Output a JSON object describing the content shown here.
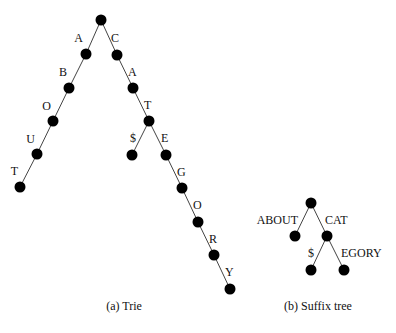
{
  "figures": [
    {
      "id": "trie",
      "caption": "(a) Trie",
      "nodes": [
        {
          "id": "root",
          "x": 101,
          "y": 20
        },
        {
          "id": "A",
          "x": 86,
          "y": 54
        },
        {
          "id": "AB",
          "x": 69,
          "y": 88
        },
        {
          "id": "ABO",
          "x": 53,
          "y": 121
        },
        {
          "id": "ABOU",
          "x": 37,
          "y": 154
        },
        {
          "id": "ABOUT",
          "x": 20,
          "y": 187
        },
        {
          "id": "C",
          "x": 117,
          "y": 55
        },
        {
          "id": "CA",
          "x": 133,
          "y": 88
        },
        {
          "id": "CAT",
          "x": 149,
          "y": 121
        },
        {
          "id": "CAT$",
          "x": 132,
          "y": 155
        },
        {
          "id": "CATE",
          "x": 166,
          "y": 155
        },
        {
          "id": "CATEG",
          "x": 182,
          "y": 188
        },
        {
          "id": "CATEGO",
          "x": 198,
          "y": 222
        },
        {
          "id": "CATEGOR",
          "x": 214,
          "y": 255
        },
        {
          "id": "CATEGORY",
          "x": 230,
          "y": 289
        }
      ],
      "edges": [
        {
          "from": "root",
          "to": "A",
          "label": "A",
          "lx": 83,
          "ly": 42,
          "anchor": "end"
        },
        {
          "from": "A",
          "to": "AB",
          "label": "B",
          "lx": 67,
          "ly": 76,
          "anchor": "end"
        },
        {
          "from": "AB",
          "to": "ABO",
          "label": "O",
          "lx": 51,
          "ly": 110,
          "anchor": "end"
        },
        {
          "from": "ABO",
          "to": "ABOU",
          "label": "U",
          "lx": 35,
          "ly": 143,
          "anchor": "end"
        },
        {
          "from": "ABOU",
          "to": "ABOUT",
          "label": "T",
          "lx": 18,
          "ly": 175,
          "anchor": "end"
        },
        {
          "from": "root",
          "to": "C",
          "label": "C",
          "lx": 111,
          "ly": 42,
          "anchor": "start"
        },
        {
          "from": "C",
          "to": "CA",
          "label": "A",
          "lx": 128,
          "ly": 76,
          "anchor": "start"
        },
        {
          "from": "CA",
          "to": "CAT",
          "label": "T",
          "lx": 144,
          "ly": 109,
          "anchor": "start"
        },
        {
          "from": "CAT",
          "to": "CAT$",
          "label": "$",
          "lx": 136,
          "ly": 142,
          "anchor": "end"
        },
        {
          "from": "CAT",
          "to": "CATE",
          "label": "E",
          "lx": 161,
          "ly": 142,
          "anchor": "start"
        },
        {
          "from": "CATE",
          "to": "CATEG",
          "label": "G",
          "lx": 177,
          "ly": 176,
          "anchor": "start"
        },
        {
          "from": "CATEG",
          "to": "CATEGO",
          "label": "O",
          "lx": 193,
          "ly": 209,
          "anchor": "start"
        },
        {
          "from": "CATEGO",
          "to": "CATEGOR",
          "label": "R",
          "lx": 209,
          "ly": 243,
          "anchor": "start"
        },
        {
          "from": "CATEGOR",
          "to": "CATEGORY",
          "label": "Y",
          "lx": 225,
          "ly": 276,
          "anchor": "start"
        }
      ],
      "caption_x": 124,
      "caption_y": 310
    },
    {
      "id": "suffix-tree",
      "caption": "(b) Suffix tree",
      "nodes": [
        {
          "id": "root",
          "x": 311,
          "y": 203
        },
        {
          "id": "ABOUT",
          "x": 295,
          "y": 236
        },
        {
          "id": "CAT",
          "x": 327,
          "y": 236
        },
        {
          "id": "CAT$",
          "x": 311,
          "y": 270
        },
        {
          "id": "CATEGORY",
          "x": 344,
          "y": 270
        }
      ],
      "edges": [
        {
          "from": "root",
          "to": "ABOUT",
          "label": "ABOUT",
          "lx": 298,
          "ly": 224,
          "anchor": "end"
        },
        {
          "from": "root",
          "to": "CAT",
          "label": "CAT",
          "lx": 325,
          "ly": 224,
          "anchor": "start"
        },
        {
          "from": "CAT",
          "to": "CAT$",
          "label": "$",
          "lx": 314,
          "ly": 257,
          "anchor": "end"
        },
        {
          "from": "CAT",
          "to": "CATEGORY",
          "label": "EGORY",
          "lx": 341,
          "ly": 257,
          "anchor": "start"
        }
      ],
      "caption_x": 318,
      "caption_y": 310
    }
  ],
  "node_radius": 5.5,
  "colors": {
    "node": "#000000",
    "edge": "#444444",
    "text": "#111111",
    "background": "#ffffff"
  }
}
